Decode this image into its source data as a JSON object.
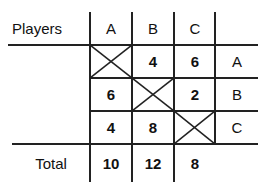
{
  "table": {
    "header_label": "Players",
    "columns": [
      "A",
      "B",
      "C"
    ],
    "rows": [
      {
        "label": "A",
        "values": [
          null,
          "4",
          "6"
        ]
      },
      {
        "label": "B",
        "values": [
          "6",
          null,
          "2"
        ]
      },
      {
        "label": "C",
        "values": [
          "4",
          "8",
          null
        ]
      }
    ],
    "total_label": "Total",
    "totals": [
      "10",
      "12",
      "8"
    ]
  }
}
